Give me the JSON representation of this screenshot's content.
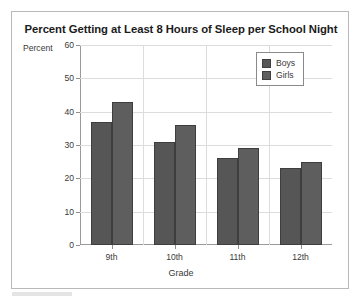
{
  "figure": {
    "title": "Percent Getting at Least 8 Hours of Sleep per School Night",
    "y_axis_caption": "Percent",
    "x_axis_title": "Grade"
  },
  "legend": {
    "position": "top-right",
    "entries": [
      {
        "label": "Boys",
        "color": "#565656"
      },
      {
        "label": "Girls",
        "color": "#5e5e5e"
      }
    ]
  },
  "axis": {
    "y_ticks": [
      "60",
      "50",
      "40",
      "30",
      "20",
      "10",
      "0"
    ],
    "x_ticks": [
      "9th",
      "10th",
      "11th",
      "12th"
    ]
  },
  "chart_data": {
    "type": "bar",
    "title": "Percent Getting at Least 8 Hours of Sleep per School Night",
    "xlabel": "Grade",
    "ylabel": "Percent",
    "categories": [
      "9th",
      "10th",
      "11th",
      "12th"
    ],
    "series": [
      {
        "name": "Boys",
        "color": "#565656",
        "values": [
          37,
          31,
          26,
          23
        ]
      },
      {
        "name": "Girls",
        "color": "#5e5e5e",
        "values": [
          43,
          36,
          29,
          25
        ]
      }
    ],
    "ylim": [
      0,
      60
    ],
    "ytick_step": 10,
    "grid": "horizontal-and-vertical",
    "legend_position": "top-right"
  }
}
